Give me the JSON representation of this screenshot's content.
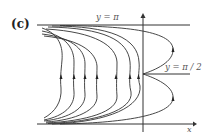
{
  "figure": {
    "panel_label": "(c)",
    "labels": {
      "top_line": "y = π",
      "mid_line": "y = π / 2",
      "x_axis": "x"
    },
    "colors": {
      "stroke": "#333333",
      "background": "#ffffff"
    },
    "axes": {
      "y_axis_x": 143,
      "x_axis_y": 124,
      "top_line_y": 25,
      "mid_line_y": 74
    },
    "trajectories": {
      "left_family_count": 7,
      "arrow_direction": "up",
      "right_separatrices": 2
    }
  }
}
